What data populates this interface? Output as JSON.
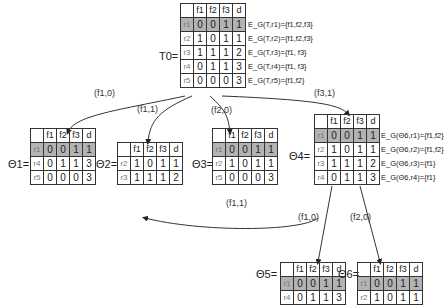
{
  "header": [
    "",
    "f1",
    "f2",
    "f3",
    "d"
  ],
  "T": {
    "label": "T0=",
    "rows": [
      {
        "r": "r1",
        "v": [
          "0",
          "0",
          "1",
          "1"
        ],
        "ann": "E_G(T,r1)={f1,f2,f3}"
      },
      {
        "r": "r2",
        "v": [
          "1",
          "0",
          "1",
          "1"
        ],
        "ann": "E_G(T,r2)={f1,f2,f3}"
      },
      {
        "r": "r3",
        "v": [
          "1",
          "1",
          "1",
          "2"
        ],
        "ann": "E_G(T,r3)={f1, f3}"
      },
      {
        "r": "r4",
        "v": [
          "0",
          "1",
          "1",
          "3"
        ],
        "ann": "E_G(T,r4)={f1, f3}"
      },
      {
        "r": "r5",
        "v": [
          "0",
          "0",
          "0",
          "3"
        ],
        "ann": "E_G(T,r5)={f1,f2}"
      }
    ]
  },
  "theta1": {
    "label": "Θ1=",
    "rows": [
      {
        "r": "r1",
        "v": [
          "0",
          "0",
          "1",
          "1"
        ]
      },
      {
        "r": "r4",
        "v": [
          "0",
          "1",
          "1",
          "3"
        ]
      },
      {
        "r": "r5",
        "v": [
          "0",
          "0",
          "0",
          "3"
        ]
      }
    ]
  },
  "theta2": {
    "label": "Θ2=",
    "rows": [
      {
        "r": "r2",
        "v": [
          "1",
          "0",
          "1",
          "1"
        ]
      },
      {
        "r": "r3",
        "v": [
          "1",
          "1",
          "1",
          "2"
        ]
      }
    ]
  },
  "theta3": {
    "label": "Θ3=",
    "rows": [
      {
        "r": "r1",
        "v": [
          "0",
          "0",
          "1",
          "1"
        ]
      },
      {
        "r": "r2",
        "v": [
          "1",
          "0",
          "1",
          "1"
        ]
      },
      {
        "r": "r5",
        "v": [
          "0",
          "0",
          "0",
          "3"
        ]
      }
    ]
  },
  "theta4": {
    "label": "Θ4=",
    "rows": [
      {
        "r": "r1",
        "v": [
          "0",
          "0",
          "1",
          "1"
        ],
        "ann": "E_G(Θ6,r1)={f1,f2}"
      },
      {
        "r": "r2",
        "v": [
          "1",
          "0",
          "1",
          "1"
        ],
        "ann": "E_G(Θ6,r2)={f1,f2}"
      },
      {
        "r": "r3",
        "v": [
          "1",
          "1",
          "1",
          "2"
        ],
        "ann": "E_G(Θ6,r3)={f1}"
      },
      {
        "r": "r4",
        "v": [
          "0",
          "1",
          "1",
          "3"
        ],
        "ann": "E_G(Θ6,r4)={f1}"
      }
    ]
  },
  "theta5": {
    "label": "Θ5=",
    "rows": [
      {
        "r": "r1",
        "v": [
          "0",
          "0",
          "1",
          "1"
        ]
      },
      {
        "r": "r4",
        "v": [
          "0",
          "1",
          "1",
          "3"
        ]
      }
    ]
  },
  "theta6": {
    "label": "Θ6=",
    "rows": [
      {
        "r": "r1",
        "v": [
          "0",
          "0",
          "1",
          "1"
        ]
      },
      {
        "r": "r2",
        "v": [
          "1",
          "0",
          "1",
          "1"
        ]
      }
    ]
  },
  "edges": [
    "(f1,0)",
    "(f1,1)",
    "(f2,0)",
    "(f3,1)",
    "(f1,1)",
    "(f1,0)",
    "(f2,0)"
  ]
}
